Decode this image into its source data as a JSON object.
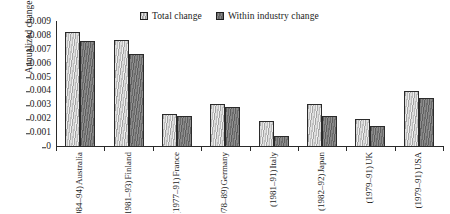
{
  "chart_data": {
    "type": "bar",
    "title": "",
    "xlabel": "",
    "ylabel": "Annualized change",
    "ylim": [
      0,
      0.009
    ],
    "yticks": [
      "0",
      "0.001",
      "0.002",
      "0.003",
      "0.004",
      "0.005",
      "0.006",
      "0.007",
      "0.008",
      "0.009"
    ],
    "ytick_values": [
      0,
      0.001,
      0.002,
      0.003,
      0.004,
      0.005,
      0.006,
      0.007,
      0.008,
      0.009
    ],
    "grid": false,
    "legend_position": "top-center",
    "categories": [
      "Australia (1984–94)",
      "Finland (1981–93)",
      "France (1977–91)",
      "Germany (1978–89)",
      "Italy (1981–91)",
      "Japan (1982–92)",
      "UK (1979–91)",
      "USA (1979–91)"
    ],
    "category_parts": [
      {
        "country": "Australia",
        "period": "(1984–94)"
      },
      {
        "country": "Finland",
        "period": "(1981–93)"
      },
      {
        "country": "France",
        "period": "(1977–91)"
      },
      {
        "country": "Germany",
        "period": "(1978–89)"
      },
      {
        "country": "Italy",
        "period": "(1981–91)"
      },
      {
        "country": "Japan",
        "period": "(1982–92)"
      },
      {
        "country": "UK",
        "period": "(1979–91)"
      },
      {
        "country": "USA",
        "period": "(1979–91)"
      }
    ],
    "series": [
      {
        "name": "Total change",
        "color": "#c6c6c6",
        "values": [
          0.0083,
          0.0077,
          0.0024,
          0.0031,
          0.0019,
          0.0031,
          0.002,
          0.004
        ]
      },
      {
        "name": "Within industry change",
        "color": "#6e6e6e",
        "values": [
          0.0076,
          0.0067,
          0.0022,
          0.0029,
          0.0008,
          0.0022,
          0.0015,
          0.0035
        ]
      }
    ]
  }
}
